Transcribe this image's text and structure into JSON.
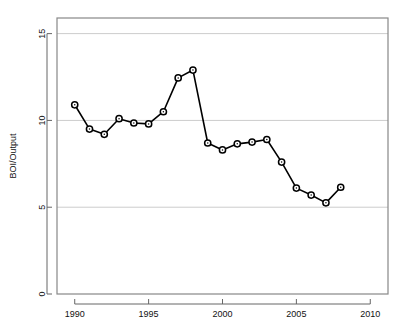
{
  "chart_data": {
    "type": "line",
    "title": "",
    "xlabel": "",
    "ylabel": "BOI/Output",
    "x": [
      1990,
      1991,
      1992,
      1993,
      1994,
      1995,
      1996,
      1997,
      1998,
      1999,
      2000,
      2001,
      2002,
      2003,
      2004,
      2005,
      2006,
      2007,
      2008
    ],
    "values": [
      10.9,
      9.5,
      9.2,
      10.1,
      9.85,
      9.8,
      10.5,
      12.45,
      12.9,
      8.7,
      8.3,
      8.65,
      8.75,
      8.9,
      7.6,
      6.1,
      5.7,
      5.25,
      6.15
    ],
    "series": [
      {
        "name": "BOI/Output",
        "values": [
          10.9,
          9.5,
          9.2,
          10.1,
          9.85,
          9.8,
          10.5,
          12.45,
          12.9,
          8.7,
          8.3,
          8.65,
          8.75,
          8.9,
          7.6,
          6.1,
          5.7,
          5.25,
          6.15
        ],
        "color": "#000000",
        "marker": "circle-open"
      }
    ],
    "xlim": [
      1988.8,
      2011.2
    ],
    "ylim": [
      0,
      15.9
    ],
    "xticks": [
      1990,
      1995,
      2000,
      2005,
      2010
    ],
    "xtick_labels": [
      "1990",
      "1995",
      "2000",
      "2005",
      "2010"
    ],
    "yticks": [
      0,
      5,
      10,
      15
    ],
    "ytick_labels": [
      "0",
      "5",
      "10",
      "15"
    ],
    "grid": true,
    "gridlines_y": [
      5,
      10,
      15
    ],
    "grid_color": "#cccccc",
    "frame": true,
    "frame_color": "#888888",
    "legend": null,
    "legend_position": "none",
    "line_color": "#000000",
    "marker_fill": "#ffffff",
    "background": "#ffffff"
  }
}
